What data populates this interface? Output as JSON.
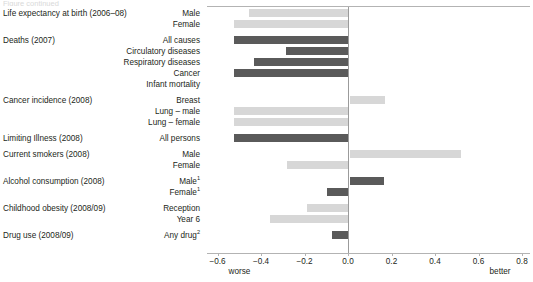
{
  "top_sliver_text": "Figure continued",
  "axis": {
    "ticks": [
      {
        "value": -0.6,
        "label": "−0.6"
      },
      {
        "value": -0.4,
        "label": "−0.4"
      },
      {
        "value": -0.2,
        "label": "−0.2"
      },
      {
        "value": 0.0,
        "label": "0.0"
      },
      {
        "value": 0.2,
        "label": "0.2"
      },
      {
        "value": 0.4,
        "label": "0.4"
      },
      {
        "value": 0.6,
        "label": "0.6"
      },
      {
        "value": 0.8,
        "label": "0.8"
      }
    ],
    "worse_label": "worse",
    "better_label": "better",
    "xmin": -0.6,
    "xmax": 0.8
  },
  "colors": {
    "light_bar": "#d7d7d7",
    "dark_bar": "#5a5a5a",
    "zero_line": "#9b9b9b",
    "axis_line": "#b3b3b3",
    "text": "#231f20"
  },
  "groups": [
    {
      "label": "Life expectancy at birth (2006–08)",
      "rows": [
        {
          "series": "Male",
          "value": -0.455,
          "shade": "light"
        },
        {
          "series": "Female",
          "value": -0.525,
          "shade": "light"
        }
      ]
    },
    {
      "label": "Deaths (2007)",
      "rows": [
        {
          "series": "All causes",
          "value": -0.525,
          "shade": "dark"
        },
        {
          "series": "Circulatory diseases",
          "value": -0.285,
          "shade": "dark"
        },
        {
          "series": "Respiratory diseases",
          "value": -0.43,
          "shade": "dark"
        },
        {
          "series": "Cancer",
          "value": -0.525,
          "shade": "dark"
        },
        {
          "series": "Infant mortality",
          "value": 0.0,
          "shade": "dark"
        }
      ]
    },
    {
      "label": "Cancer incidence (2008)",
      "rows": [
        {
          "series": "Breast",
          "value": 0.17,
          "shade": "light"
        },
        {
          "series": "Lung – male",
          "value": -0.525,
          "shade": "light"
        },
        {
          "series": "Lung – female",
          "value": -0.525,
          "shade": "light"
        }
      ]
    },
    {
      "label": "Limiting Illness (2008)",
      "rows": [
        {
          "series": "All persons",
          "value": -0.525,
          "shade": "dark"
        }
      ]
    },
    {
      "label": "Current smokers (2008)",
      "rows": [
        {
          "series": "Male",
          "value": 0.52,
          "shade": "light"
        },
        {
          "series": "Female",
          "value": -0.28,
          "shade": "light"
        }
      ]
    },
    {
      "label": "Alcohol consumption (2008)",
      "rows": [
        {
          "series": "Male",
          "series_sup": "1",
          "value": 0.165,
          "shade": "dark"
        },
        {
          "series": "Female",
          "series_sup": "1",
          "value": -0.098,
          "shade": "dark"
        }
      ]
    },
    {
      "label": "Childhood obesity (2008/09)",
      "rows": [
        {
          "series": "Reception",
          "value": -0.19,
          "shade": "light"
        },
        {
          "series": "Year 6",
          "value": -0.36,
          "shade": "light"
        }
      ]
    },
    {
      "label": "Drug use (2008/09)",
      "rows": [
        {
          "series": "Any drug",
          "series_sup": "2",
          "value": -0.075,
          "shade": "dark"
        }
      ]
    }
  ],
  "chart_data": {
    "type": "bar",
    "title": "",
    "subtitle": "",
    "xlabel": "",
    "ylabel": "",
    "orientation": "horizontal",
    "xlim": [
      -0.6,
      0.8
    ],
    "xticks": [
      -0.6,
      -0.4,
      -0.2,
      0.0,
      0.2,
      0.4,
      0.6,
      0.8
    ],
    "grid": false,
    "legend": null,
    "annotations": [
      "worse",
      "better"
    ],
    "zero_reference_line": 0.0,
    "categories": [
      "Life expectancy at birth (2006–08) – Male",
      "Life expectancy at birth (2006–08) – Female",
      "Deaths (2007) – All causes",
      "Deaths (2007) – Circulatory diseases",
      "Deaths (2007) – Respiratory diseases",
      "Deaths (2007) – Cancer",
      "Deaths (2007) – Infant mortality",
      "Cancer incidence (2008) – Breast",
      "Cancer incidence (2008) – Lung – male",
      "Cancer incidence (2008) – Lung – female",
      "Limiting Illness (2008) – All persons",
      "Current smokers (2008) – Male",
      "Current smokers (2008) – Female",
      "Alcohol consumption (2008) – Male¹",
      "Alcohol consumption (2008) – Female¹",
      "Childhood obesity (2008/09) – Reception",
      "Childhood obesity (2008/09) – Year 6",
      "Drug use (2008/09) – Any drug²"
    ],
    "values": [
      -0.455,
      -0.525,
      -0.525,
      -0.285,
      -0.43,
      -0.525,
      0.0,
      0.17,
      -0.525,
      -0.525,
      -0.525,
      0.52,
      -0.28,
      0.165,
      -0.098,
      -0.19,
      -0.36,
      -0.075
    ]
  }
}
